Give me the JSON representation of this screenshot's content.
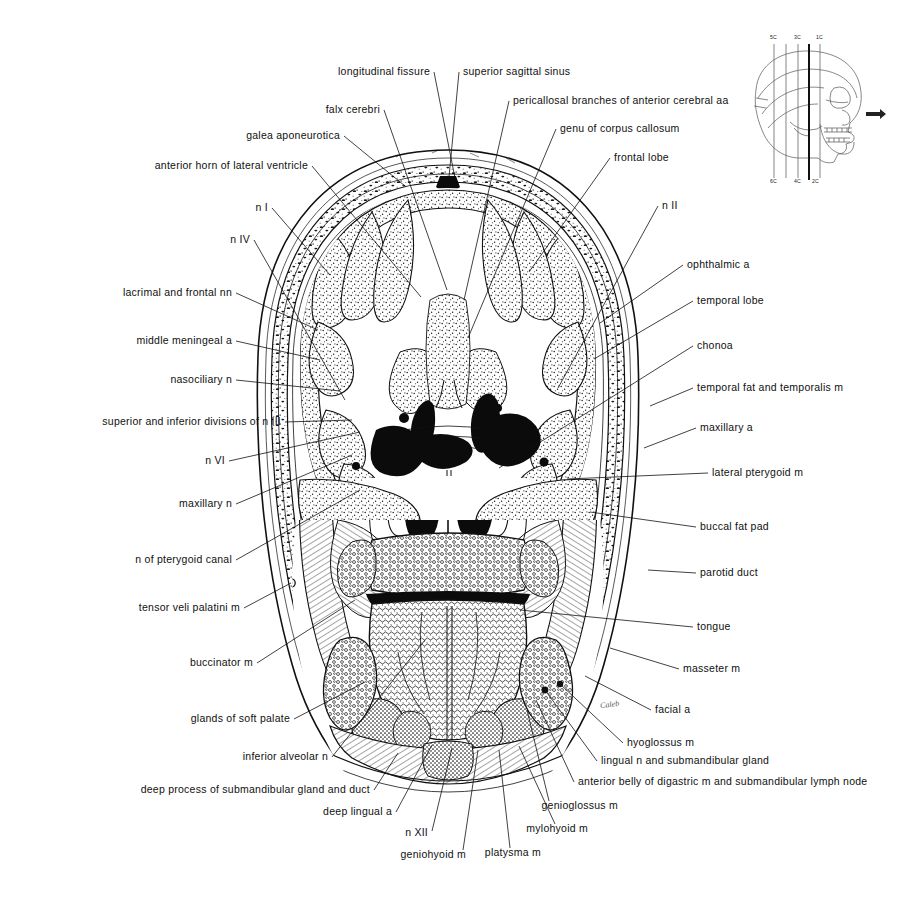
{
  "figure": {
    "artist_signature": "Caleb",
    "ink_color": "#111111",
    "background_color": "#ffffff"
  },
  "key_diagram": {
    "name": "lateral skull orientation diagram",
    "top_plane_labels": [
      "5C",
      "3C",
      "1C"
    ],
    "bottom_plane_labels": [
      "6C",
      "4C",
      "2C"
    ],
    "highlighted_plane": "3C",
    "arrow": "anterior direction arrow"
  },
  "labels_left": [
    {
      "text": "longitudinal fissure",
      "x": 430,
      "y": 72,
      "lx": 434,
      "ly": 72,
      "tx": 455,
      "ty": 178
    },
    {
      "text": "falx cerebri",
      "x": 380,
      "y": 110,
      "lx": 384,
      "ly": 110,
      "tx": 447,
      "ty": 290
    },
    {
      "text": "galea aponeurotica",
      "x": 340,
      "y": 136,
      "lx": 344,
      "ly": 136,
      "tx": 405,
      "ty": 186
    },
    {
      "text": "anterior horn of lateral ventricle",
      "x": 308,
      "y": 166,
      "lx": 312,
      "ly": 166,
      "tx": 421,
      "ty": 297
    },
    {
      "text": "n I",
      "x": 268,
      "y": 208,
      "lx": 272,
      "ly": 208,
      "tx": 330,
      "ty": 275
    },
    {
      "text": "n IV",
      "x": 250,
      "y": 240,
      "lx": 254,
      "ly": 240,
      "tx": 345,
      "ty": 400
    },
    {
      "text": "lacrimal and frontal nn",
      "x": 232,
      "y": 293,
      "lx": 236,
      "ly": 293,
      "tx": 318,
      "ty": 330
    },
    {
      "text": "middle meningeal a",
      "x": 232,
      "y": 341,
      "lx": 236,
      "ly": 341,
      "tx": 320,
      "ty": 360
    },
    {
      "text": "nasociliary n",
      "x": 232,
      "y": 380,
      "lx": 236,
      "ly": 380,
      "tx": 340,
      "ty": 391
    },
    {
      "text": "superior and inferior divisions of n III",
      "x": 281,
      "y": 422,
      "lx": 285,
      "ly": 422,
      "tx": 352,
      "ty": 420
    },
    {
      "text": "n VI",
      "x": 225,
      "y": 461,
      "lx": 229,
      "ly": 461,
      "tx": 360,
      "ty": 432
    },
    {
      "text": "maxillary n",
      "x": 232,
      "y": 504,
      "lx": 236,
      "ly": 504,
      "tx": 352,
      "ty": 455
    },
    {
      "text": "n of pterygoid canal",
      "x": 232,
      "y": 560,
      "lx": 236,
      "ly": 560,
      "tx": 360,
      "ty": 490
    },
    {
      "text": "tensor veli palatini m",
      "x": 240,
      "y": 608,
      "lx": 244,
      "ly": 608,
      "tx": 291,
      "ty": 583
    },
    {
      "text": "buccinator m",
      "x": 253,
      "y": 663,
      "lx": 257,
      "ly": 663,
      "tx": 355,
      "ty": 600
    },
    {
      "text": "glands of soft palate",
      "x": 290,
      "y": 719,
      "lx": 294,
      "ly": 719,
      "tx": 365,
      "ty": 682
    },
    {
      "text": "inferior alveolar n",
      "x": 328,
      "y": 757,
      "lx": 332,
      "ly": 757,
      "tx": 425,
      "ty": 640
    },
    {
      "text": "deep process of submandibular gland and duct",
      "x": 370,
      "y": 790,
      "lx": 374,
      "ly": 790,
      "tx": 398,
      "ty": 753
    },
    {
      "text": "deep lingual a",
      "x": 392,
      "y": 812,
      "lx": 396,
      "ly": 812,
      "tx": 432,
      "ty": 745
    },
    {
      "text": "n XII",
      "x": 428,
      "y": 833,
      "lx": 432,
      "ly": 831,
      "tx": 452,
      "ty": 748
    },
    {
      "text": "geniohyoid m",
      "x": 466,
      "y": 855,
      "lx": 463,
      "ly": 850,
      "tx": 478,
      "ty": 750
    },
    {
      "text": "platysma m",
      "x": 541,
      "y": 853,
      "lx": 510,
      "ly": 848,
      "tx": 499,
      "ty": 750
    },
    {
      "text": "mylohyoid m",
      "x": 588,
      "y": 829,
      "lx": 555,
      "ly": 824,
      "tx": 519,
      "ty": 746
    },
    {
      "text": "genioglossus m",
      "x": 618,
      "y": 806,
      "lx": 549,
      "ly": 801,
      "tx": 527,
      "ty": 710
    }
  ],
  "labels_right": [
    {
      "text": "superior sagittal sinus",
      "x": 463,
      "y": 72,
      "lx": 459,
      "ly": 72,
      "tx": 449,
      "ty": 177
    },
    {
      "text": "pericallosal branches of anterior cerebral aa",
      "x": 513,
      "y": 101,
      "lx": 509,
      "ly": 101,
      "tx": 464,
      "ty": 300
    },
    {
      "text": "genu of corpus callosum",
      "x": 560,
      "y": 129,
      "lx": 556,
      "ly": 129,
      "tx": 468,
      "ty": 338
    },
    {
      "text": "frontal lobe",
      "x": 614,
      "y": 158,
      "lx": 610,
      "ly": 158,
      "tx": 529,
      "ty": 272
    },
    {
      "text": "n II",
      "x": 662,
      "y": 206,
      "lx": 658,
      "ly": 206,
      "tx": 558,
      "ty": 388
    },
    {
      "text": "ophthalmic a",
      "x": 687,
      "y": 265,
      "lx": 683,
      "ly": 265,
      "tx": 600,
      "ty": 323
    },
    {
      "text": "temporal lobe",
      "x": 697,
      "y": 301,
      "lx": 693,
      "ly": 301,
      "tx": 594,
      "ty": 359
    },
    {
      "text": "chonoa",
      "x": 697,
      "y": 346,
      "lx": 693,
      "ly": 346,
      "tx": 499,
      "ty": 468
    },
    {
      "text": "temporal fat and temporalis m",
      "x": 697,
      "y": 388,
      "lx": 693,
      "ly": 388,
      "tx": 650,
      "ty": 406
    },
    {
      "text": "maxillary a",
      "x": 700,
      "y": 428,
      "lx": 696,
      "ly": 428,
      "tx": 644,
      "ty": 448
    },
    {
      "text": "lateral pterygoid m",
      "x": 712,
      "y": 473,
      "lx": 708,
      "ly": 473,
      "tx": 567,
      "ty": 479
    },
    {
      "text": "buccal fat pad",
      "x": 700,
      "y": 527,
      "lx": 696,
      "ly": 527,
      "tx": 590,
      "ty": 512
    },
    {
      "text": "parotid duct",
      "x": 700,
      "y": 573,
      "lx": 696,
      "ly": 573,
      "tx": 648,
      "ty": 570
    },
    {
      "text": "tongue",
      "x": 697,
      "y": 627,
      "lx": 693,
      "ly": 627,
      "tx": 520,
      "ty": 610
    },
    {
      "text": "masseter m",
      "x": 683,
      "y": 669,
      "lx": 679,
      "ly": 669,
      "tx": 610,
      "ty": 648
    },
    {
      "text": "facial a",
      "x": 655,
      "y": 710,
      "lx": 651,
      "ly": 710,
      "tx": 585,
      "ty": 676
    },
    {
      "text": "hyoglossus m",
      "x": 627,
      "y": 743,
      "lx": 623,
      "ly": 743,
      "tx": 560,
      "ty": 684
    },
    {
      "text": "lingual n and submandibular gland",
      "x": 601,
      "y": 761,
      "lx": 597,
      "ly": 761,
      "tx": 545,
      "ty": 690
    },
    {
      "text": "anterior belly of digastric m and submandibular lymph node",
      "x": 578,
      "y": 782,
      "lx": 574,
      "ly": 782,
      "tx": 536,
      "ty": 700
    }
  ]
}
